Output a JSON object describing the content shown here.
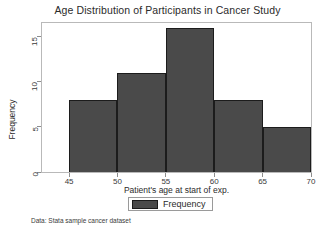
{
  "chart_data": {
    "type": "bar",
    "title": "Age Distribution of Participants in Cancer Study",
    "xlabel": "Patient's age at start of exp.",
    "ylabel": "Frequency",
    "categories": [
      "45-50",
      "50-55",
      "55-60",
      "60-65",
      "65-70"
    ],
    "bin_edges": [
      45,
      50,
      55,
      60,
      65,
      70
    ],
    "values": [
      8,
      11,
      16,
      8,
      5
    ],
    "series": [
      {
        "name": "Frequency",
        "values": [
          8,
          11,
          16,
          8,
          5
        ]
      }
    ],
    "xlim": [
      42.2,
      70
    ],
    "ylim": [
      0,
      16.5
    ],
    "xticks": [
      45,
      50,
      55,
      60,
      65,
      70
    ],
    "yticks": [
      0,
      5,
      10,
      15
    ],
    "grid": false,
    "legend_position": "bottom",
    "bar_color": "#4a4a4a",
    "bar_edge_color": "#1c1c1c",
    "frame_color": "#b9b9b9",
    "annotations": [
      "Data:  Stata sample cancer dataset"
    ]
  },
  "legend": {
    "entries": [
      {
        "label": "Frequency"
      }
    ]
  },
  "footnote": {
    "text": "Data:  Stata sample cancer dataset"
  }
}
